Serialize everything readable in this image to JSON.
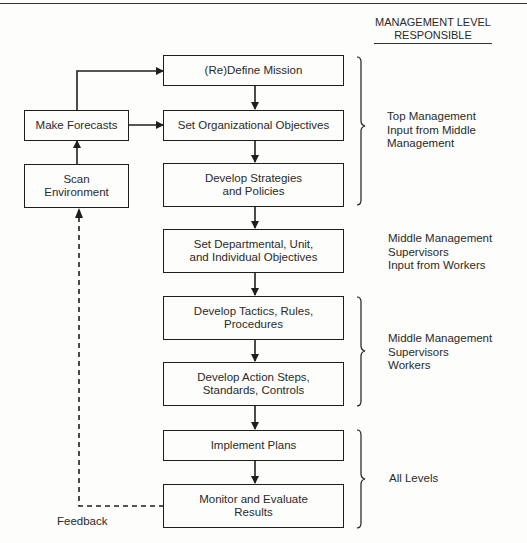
{
  "header": {
    "column_title": "MANAGEMENT LEVEL\nRESPONSIBLE"
  },
  "boxes": {
    "mission": "(Re)Define Mission",
    "org_objectives": "Set Organizational Objectives",
    "strategies": "Develop Strategies\nand Policies",
    "departmental": "Set Departmental, Unit,\nand Individual Objectives",
    "tactics": "Develop Tactics, Rules,\nProcedures",
    "action_steps": "Develop Action Steps,\nStandards, Controls",
    "implement": "Implement Plans",
    "monitor": "Monitor and Evaluate\nResults",
    "forecasts": "Make Forecasts",
    "scan": "Scan\nEnvironment"
  },
  "levels": {
    "top": "Top Management\nInput from Middle\n  Management",
    "middle_input": "Middle Management\nSupervisors\nInput from Workers",
    "middle_workers": "Middle Management\nSupervisors\nWorkers",
    "all": "All Levels"
  },
  "feedback_label": "Feedback",
  "colors": {
    "line": "#1e1e1e",
    "background": "#fdfdfb"
  }
}
